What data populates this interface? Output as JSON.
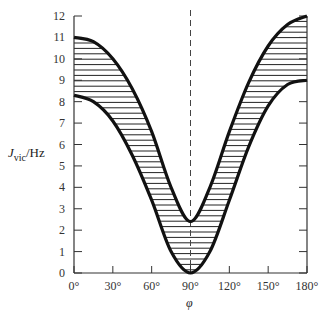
{
  "chart_data": {
    "type": "area",
    "title": "",
    "xlabel": "φ",
    "ylabel": "J_vic/Hz",
    "xlim": [
      0,
      180
    ],
    "ylim": [
      0,
      12
    ],
    "x_ticks": [
      "0°",
      "30°",
      "60°",
      "90°",
      "120°",
      "150°",
      "180°"
    ],
    "y_ticks": [
      "0",
      "1",
      "2",
      "3",
      "4",
      "5",
      "6",
      "7",
      "8",
      "9",
      "10",
      "11",
      "12"
    ],
    "annotations": [
      "dashed vertical line at φ = 90°",
      "shaded (hatched) band between curves"
    ],
    "x": [
      0,
      15,
      30,
      45,
      60,
      75,
      90,
      105,
      120,
      135,
      150,
      165,
      180
    ],
    "series": [
      {
        "name": "upper bound",
        "values": [
          11.0,
          10.8,
          10.0,
          8.6,
          6.6,
          4.0,
          2.4,
          4.0,
          6.6,
          8.9,
          10.6,
          11.6,
          12.0
        ]
      },
      {
        "name": "lower bound",
        "values": [
          8.3,
          8.0,
          7.1,
          5.5,
          3.4,
          1.0,
          0.0,
          1.0,
          3.4,
          5.9,
          7.8,
          8.8,
          9.0
        ]
      }
    ],
    "grid": false,
    "legend": "none"
  },
  "labels": {
    "ylabel_main": "J",
    "ylabel_sub": "vic",
    "ylabel_unit": "/Hz",
    "xlabel": "φ"
  }
}
